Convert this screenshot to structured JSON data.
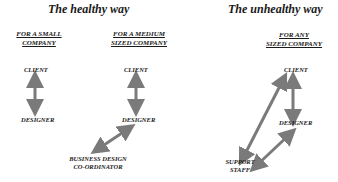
{
  "sections": {
    "healthy": {
      "title": "The healthy way",
      "small": {
        "header": [
          "FOR A SMALL",
          "COMPANY"
        ],
        "nodes": [
          "CLIENT",
          "DESIGNER"
        ]
      },
      "medium": {
        "header": [
          "FOR A MEDIUM",
          "SIZED COMPANY"
        ],
        "nodes": [
          "CLIENT",
          "DESIGNER",
          "BUSINESS DESIGN",
          "CO-ORDINATOR"
        ]
      }
    },
    "unhealthy": {
      "title": "The unhealthy way",
      "any": {
        "header": [
          "FOR  ANY",
          "SIZED COMPANY"
        ],
        "nodes": [
          "CLIENT",
          "DESIGNER",
          "SUPPORT",
          "STAFF"
        ]
      }
    }
  },
  "colors": {
    "arrow": "#7a7a7a",
    "text": "#1a1a1a"
  }
}
